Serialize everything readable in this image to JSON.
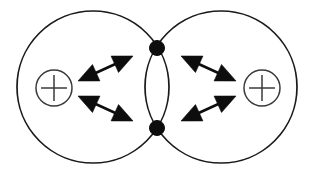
{
  "figure": {
    "domain": "diagram",
    "background_color": "#ffffff",
    "line_color": "#1a1a1a",
    "accent_color": "#0d0d0d",
    "width": 314,
    "height": 176
  },
  "shells": [
    {
      "name": "left-shell",
      "label": "",
      "cx": 93,
      "cy": 87,
      "r": 76,
      "stroke": "#1a1a1a"
    },
    {
      "name": "right-shell",
      "label": "",
      "cx": 221,
      "cy": 87,
      "r": 76,
      "stroke": "#1a1a1a"
    }
  ],
  "charges": [
    {
      "name": "left-charge",
      "symbol": "+",
      "glyph": "plus-in-circle",
      "cx": 54,
      "cy": 88,
      "r": 18,
      "stroke": "#3a3a3a"
    },
    {
      "name": "right-charge",
      "symbol": "+",
      "glyph": "plus-in-circle",
      "cx": 262,
      "cy": 88,
      "r": 18,
      "stroke": "#3a3a3a"
    }
  ],
  "nodes": [
    {
      "name": "top-intersection-node",
      "label": "",
      "cx": 157,
      "cy": 48,
      "r": 7.5,
      "fill": "#0d0d0d"
    },
    {
      "name": "bottom-intersection-node",
      "label": "",
      "cx": 157,
      "cy": 128,
      "r": 7.5,
      "fill": "#0d0d0d"
    }
  ],
  "arrows": [
    {
      "name": "arrow-upper-left",
      "label": "",
      "double_headed": true,
      "x1": 78,
      "y1": 81,
      "x2": 133,
      "y2": 56,
      "head_len": 20,
      "head_half_width": 9
    },
    {
      "name": "arrow-lower-left",
      "label": "",
      "double_headed": true,
      "x1": 78,
      "y1": 96,
      "x2": 133,
      "y2": 121,
      "head_len": 20,
      "head_half_width": 9
    },
    {
      "name": "arrow-upper-right",
      "label": "",
      "double_headed": true,
      "x1": 236,
      "y1": 81,
      "x2": 181,
      "y2": 56,
      "head_len": 20,
      "head_half_width": 9
    },
    {
      "name": "arrow-lower-right",
      "label": "",
      "double_headed": true,
      "x1": 236,
      "y1": 96,
      "x2": 181,
      "y2": 121,
      "head_len": 20,
      "head_half_width": 9
    }
  ],
  "captions": []
}
